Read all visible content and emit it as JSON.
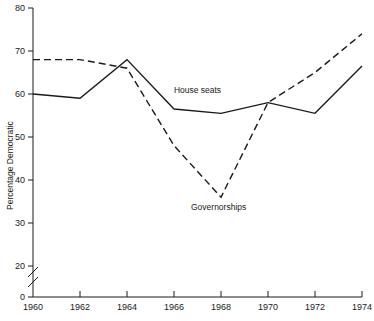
{
  "chart_data": {
    "type": "line",
    "title": "",
    "xlabel": "",
    "ylabel": "Percentage Democratic",
    "x": [
      1960,
      1962,
      1964,
      1966,
      1968,
      1970,
      1972,
      1974
    ],
    "xtick_labels": [
      "1960",
      "1962",
      "1964",
      "1966",
      "1968",
      "1970",
      "1972",
      "1974"
    ],
    "ytick_labels": [
      "0",
      "20",
      "30",
      "40",
      "50",
      "60",
      "70",
      "80"
    ],
    "ytick_values": [
      0,
      20,
      30,
      40,
      50,
      60,
      70,
      80
    ],
    "ylim": [
      0,
      80
    ],
    "xlim": [
      1960,
      1974
    ],
    "y_axis_break": true,
    "y_axis_break_between": [
      0,
      20
    ],
    "grid": false,
    "legend": "inline-labels",
    "series": [
      {
        "name": "House seats",
        "style": "solid",
        "color": "#1a1a1a",
        "label_x": 1967.0,
        "label_y": 60.2,
        "values": [
          60,
          59,
          68,
          56.5,
          55.5,
          58,
          55.5,
          66.5
        ]
      },
      {
        "name": "Governorships",
        "style": "dashed",
        "color": "#1a1a1a",
        "label_x": 1967.9,
        "label_y": 33.0,
        "values": [
          68,
          68,
          66,
          48,
          36,
          58,
          65,
          74
        ]
      }
    ]
  },
  "labels": {
    "y_axis_title": "Percentage Democratic",
    "series_one": "House seats",
    "series_two": "Governorships"
  }
}
